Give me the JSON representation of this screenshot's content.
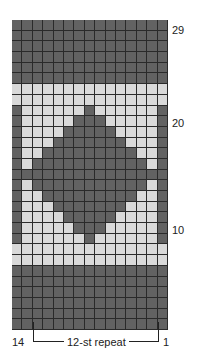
{
  "chart": {
    "title": "",
    "columns": 15,
    "rows": 29,
    "colors": {
      "dark": "#626262",
      "light": "#d9d9d9",
      "gridline": "#2a2a2a"
    },
    "row_labels": [
      {
        "text": "29",
        "row_from_top": 0
      },
      {
        "text": "20",
        "row_from_top": 9
      },
      {
        "text": "10",
        "row_from_top": 19
      }
    ],
    "bottom_labels": {
      "left": "14",
      "repeat": "12-st repeat",
      "right": "1"
    },
    "pattern": [
      "DDDDDDDDDDDDDDD",
      "DDDDDDDDDDDDDDD",
      "DDDDDDDDDDDDDDD",
      "DDDDDDDDDDDDDDD",
      "DDDDDDDDDDDDDDD",
      "DDDDDDDDDDDDDDD",
      "LLLLLLLLLLLLLLL",
      "LLLLLLLLLLLLLLL",
      "DLLLLLLDLLLLLLD",
      "DLLLLLDDDLLLLLD",
      "DLLLLDDDDDLLLLD",
      "DLLLDDDDDDDLLLD",
      "DLLDDDDDDDDDLLD",
      "DLDDDDDDDDDDDLD",
      "DDDDDDDDDDDDDDD",
      "DLDDDDDDDDDDDLD",
      "DLLDDDDDDDDDLLD",
      "DLLLDDDDDDDLLLD",
      "DLLLLDDDDDLLLLD",
      "DLLLLLDDDLLLLLD",
      "DLLLLLLDLLLLLLD",
      "LLLLLLLLLLLLLLL",
      "LLLLLLLLLLLLLLL",
      "DDDDDDDDDDDDDDD",
      "DDDDDDDDDDDDDDD",
      "DDDDDDDDDDDDDDD",
      "DDDDDDDDDDDDDDD",
      "DDDDDDDDDDDDDDD",
      "DDDDDDDDDDDDDDD"
    ]
  }
}
